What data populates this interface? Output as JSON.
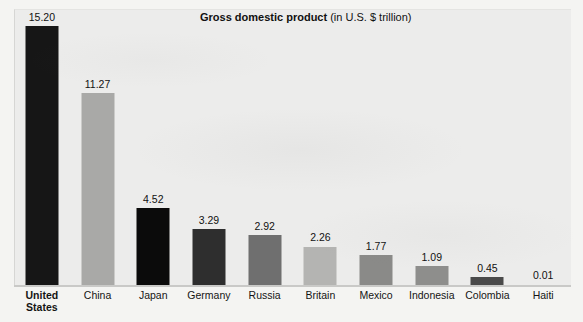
{
  "chart_data": {
    "type": "bar",
    "title": "Gross domestic product",
    "subtitle": "(in U.S. $ trillion)",
    "xlabel": "",
    "ylabel": "",
    "ylim": [
      0,
      15.2
    ],
    "grid": false,
    "legend": "none",
    "value_label_format": "2-decimal",
    "categories": [
      "United\nStates",
      "China",
      "Japan",
      "Germany",
      "Russia",
      "Britain",
      "Mexico",
      "Indonesia",
      "Colombia",
      "Haiti"
    ],
    "values": [
      15.2,
      11.27,
      4.52,
      3.29,
      2.92,
      2.26,
      1.77,
      1.09,
      0.45,
      0.01
    ],
    "value_labels": [
      "15.20",
      "11.27",
      "4.52",
      "3.29",
      "2.92",
      "2.26",
      "1.77",
      "1.09",
      "0.45",
      "0.01"
    ],
    "bar_colors": [
      "#161616",
      "#a9a9a7",
      "#0b0b0b",
      "#2e2e2e",
      "#6f6f6f",
      "#b4b4b2",
      "#8a8a88",
      "#8e8e8c",
      "#4a4a4a",
      "#c8c8c6"
    ],
    "highlight_category": "United\nStates"
  },
  "colors": {
    "panel_background": "#ececeb",
    "page_background": "#f4f4f2",
    "axis_line": "#c9c9c7",
    "text": "#111111"
  }
}
